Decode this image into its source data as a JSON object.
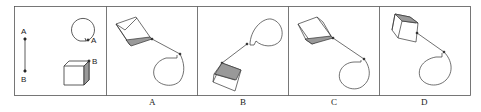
{
  "question": {
    "reference_panel": {
      "line_labels": [
        "A",
        "B"
      ],
      "circle_point_label": "A",
      "cube_point_label": "B"
    },
    "options": [
      {
        "label": "A"
      },
      {
        "label": "B"
      },
      {
        "label": "C"
      },
      {
        "label": "D"
      }
    ]
  },
  "colors": {
    "stroke": "#333333",
    "shade": "#aaaaaa",
    "border": "#555555"
  }
}
